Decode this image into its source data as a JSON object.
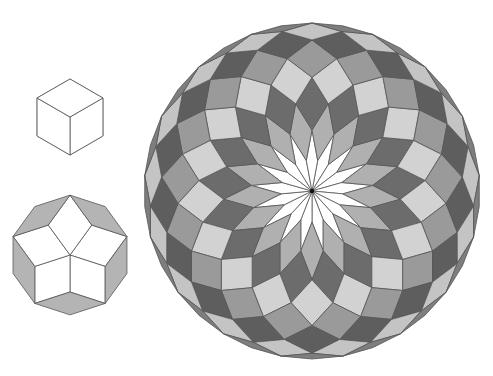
{
  "figures": [
    {
      "name": "cube-hexagon",
      "n": 3,
      "center": [
        70,
        117
      ],
      "edge": 38,
      "rotation_deg": 90,
      "colors": [
        "#ffffff"
      ]
    },
    {
      "name": "decagon-rhombic-tiling",
      "n": 5,
      "center": [
        70,
        255
      ],
      "edge": 37,
      "rotation_deg": 90,
      "colors": [
        "#ffffff",
        "#b4b4b4"
      ]
    },
    {
      "name": "large-rhombic-zonogon",
      "n": 17,
      "center": [
        312,
        191
      ],
      "edge": 31,
      "rotation_deg": 90,
      "colors": [
        "#ffffff",
        "#b0b0b0",
        "#6c6c6c",
        "#d2d2d2",
        "#9a9a9a",
        "#5e5e5e",
        "#c4c4c4",
        "#7e7e7e",
        "#aeaeae"
      ]
    }
  ],
  "stroke": "#555555",
  "background": "#ffffff"
}
